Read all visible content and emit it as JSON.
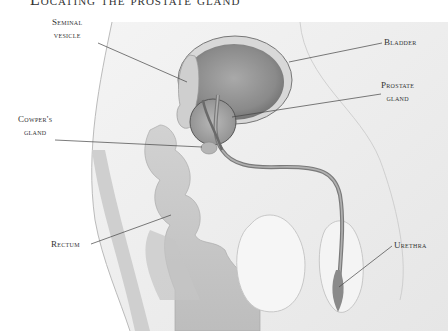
{
  "diagram": {
    "title": "Locating the prostate gland",
    "type": "anatomical-illustration",
    "view": "sagittal section, male pelvis",
    "palette": {
      "background": "#ffffff",
      "tissue_light": "#ececec",
      "tissue_mid": "#c8c8c8",
      "tissue_dark": "#8e8e8e",
      "outline": "#555555",
      "leader_line": "#444444",
      "label_text": "#333333"
    }
  },
  "labels": {
    "seminal_vesicle": {
      "line1": "Seminal",
      "line2": "vesicle"
    },
    "bladder": {
      "line1": "Bladder"
    },
    "prostate_gland": {
      "line1": "Prostate",
      "line2": "gland"
    },
    "cowpers_gland": {
      "line1": "Cowper's",
      "line2": "gland"
    },
    "rectum": {
      "line1": "Rectum"
    },
    "urethra": {
      "line1": "Urethra"
    }
  }
}
